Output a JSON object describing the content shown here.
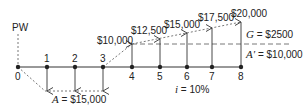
{
  "diagram": {
    "type": "cash-flow-diagram",
    "present_worth_label": "PW",
    "periods": [
      "0",
      "1",
      "2",
      "3",
      "4",
      "5",
      "6",
      "7",
      "8"
    ],
    "outflows": {
      "periods": [
        1,
        2,
        3
      ],
      "label_var": "A",
      "label_value": " = $15,000"
    },
    "inflows": [
      {
        "period": 4,
        "label": "$10,000"
      },
      {
        "period": 5,
        "label": "$12,500"
      },
      {
        "period": 6,
        "label": "$15,000"
      },
      {
        "period": 7,
        "label": "$17,500"
      },
      {
        "period": 8,
        "label": "$20,000"
      }
    ],
    "gradient": {
      "label_var": "G",
      "label_value": " = $2500"
    },
    "base": {
      "label_var": "A′",
      "label_value": " = $10,000"
    },
    "interest": {
      "label_var": "i",
      "label_value": " = 10%"
    },
    "colors": {
      "line": "#222222",
      "dashed": "#555555"
    }
  }
}
